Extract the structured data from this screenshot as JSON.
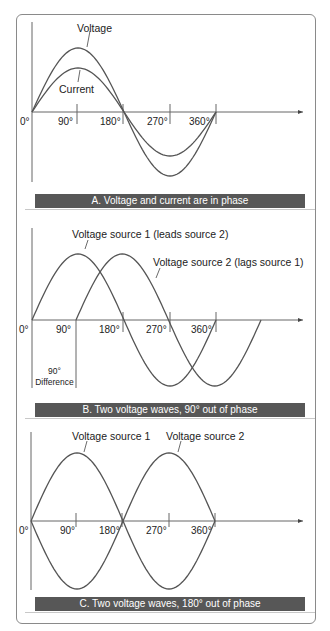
{
  "figure": {
    "panels": [
      {
        "id": "A",
        "caption": "A. Voltage and current are in phase",
        "labels": {
          "wave1": "Voltage",
          "wave2": "Current"
        },
        "ticks": [
          "0°",
          "90°",
          "180°",
          "270°",
          "360°"
        ]
      },
      {
        "id": "B",
        "caption": "B. Two voltage waves, 90° out of phase",
        "labels": {
          "wave1": "Voltage source 1 (leads source 2)",
          "wave2": "Voltage source 2 (lags source 1)"
        },
        "ticks": [
          "0°",
          "90°",
          "180°",
          "270°",
          "360°"
        ],
        "difference_label_top": "90°",
        "difference_label_bottom": "Difference"
      },
      {
        "id": "C",
        "caption": "C. Two voltage waves, 180° out of phase",
        "labels": {
          "wave1": "Voltage source 1",
          "wave2": "Voltage source 2"
        },
        "ticks": [
          "0°",
          "90°",
          "180°",
          "270°",
          "360°"
        ]
      }
    ],
    "colors": {
      "curve": "#555555",
      "axis": "#666666",
      "caption_bg": "#575757",
      "caption_text": "#ffffff"
    }
  }
}
